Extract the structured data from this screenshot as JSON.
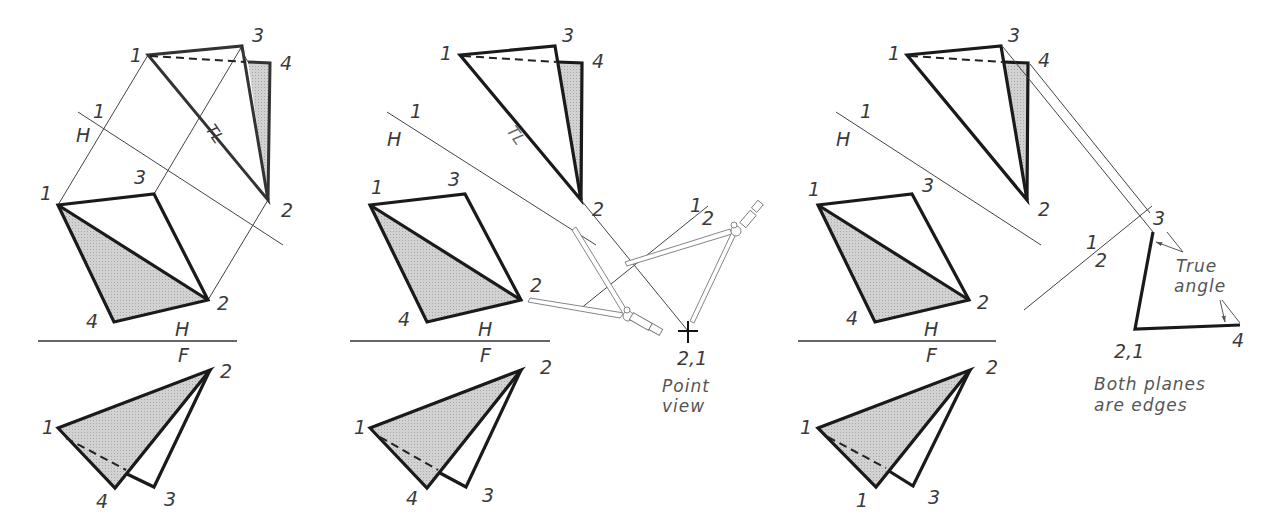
{
  "figure": {
    "colors": {
      "line": "#1a1a1a",
      "shade": "#c9c9c9",
      "construction": "#444444",
      "background": "#ffffff"
    }
  },
  "panels": [
    {
      "id": "step-1",
      "fold_lines": [
        {
          "name": "H-F",
          "above": "H",
          "below": "F"
        },
        {
          "name": "H-1",
          "above": "1",
          "below": "H"
        }
      ],
      "labels": {
        "aux": {
          "p1": "1",
          "p3": "3",
          "p4": "4",
          "p2": "2",
          "tl": "TL"
        },
        "fold_h1": {
          "a": "1",
          "b": "H"
        },
        "top": {
          "p1": "1",
          "p3": "3",
          "p2": "2",
          "p4": "4"
        },
        "fold_hf": {
          "a": "H",
          "b": "F"
        },
        "front": {
          "p2": "2",
          "p1": "1",
          "p4": "4",
          "p3": "3"
        }
      }
    },
    {
      "id": "step-2",
      "labels": {
        "aux": {
          "p1": "1",
          "p3": "3",
          "p4": "4",
          "p2": "2",
          "tl": "TL"
        },
        "fold_h1": {
          "a": "1",
          "b": "H"
        },
        "fold_12": {
          "a": "1",
          "b": "2"
        },
        "top": {
          "p1": "1",
          "p3": "3",
          "p2": "2",
          "p4": "4"
        },
        "fold_hf": {
          "a": "H",
          "b": "F"
        },
        "front": {
          "p2": "2",
          "p1": "1",
          "p4": "4",
          "p3": "3"
        },
        "point_view": {
          "label": "2,1",
          "note_line1": "Point",
          "note_line2": "view"
        }
      },
      "tool": "dividers/compass"
    },
    {
      "id": "step-3",
      "labels": {
        "aux": {
          "p1": "1",
          "p3": "3",
          "p4": "4",
          "p2": "2"
        },
        "fold_h1": {
          "a": "1",
          "b": "H"
        },
        "fold_12": {
          "a": "1",
          "b": "2"
        },
        "top": {
          "p1": "1",
          "p3": "3",
          "p2": "2",
          "p4": "4"
        },
        "fold_hf": {
          "a": "H",
          "b": "F"
        },
        "front": {
          "p2": "2",
          "p1": "1",
          "p4": "1",
          "p3": "3"
        },
        "edge_view": {
          "p3": "3",
          "p21": "2,1",
          "p4": "4"
        },
        "true_angle": {
          "line1": "True",
          "line2": "angle"
        },
        "conclusion": {
          "line1": "Both planes",
          "line2": "are edges"
        }
      }
    }
  ]
}
